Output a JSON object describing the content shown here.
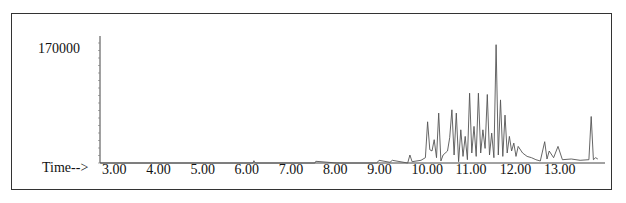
{
  "chart_data": {
    "type": "line",
    "title": "",
    "xlabel": "Time-->",
    "ylabel": "",
    "x_ticks": [
      "3.00",
      "4.00",
      "5.00",
      "6.00",
      "7.00",
      "8.00",
      "9.00",
      "10.00",
      "11.00",
      "12.00",
      "13.00"
    ],
    "y_ticks": [
      "170000"
    ],
    "xlim": [
      2.65,
      13.95
    ],
    "ylim": [
      0,
      190000
    ],
    "grid": false,
    "series": [
      {
        "name": "TIC",
        "x": [
          2.65,
          6.1,
          6.12,
          6.15,
          7.5,
          7.52,
          8.0,
          8.9,
          8.95,
          9.2,
          9.25,
          9.6,
          9.65,
          9.7,
          9.9,
          10.0,
          10.05,
          10.1,
          10.15,
          10.2,
          10.25,
          10.3,
          10.35,
          10.4,
          10.5,
          10.55,
          10.6,
          10.65,
          10.7,
          10.75,
          10.8,
          10.85,
          10.9,
          10.95,
          11.0,
          11.05,
          11.1,
          11.15,
          11.2,
          11.25,
          11.3,
          11.35,
          11.4,
          11.45,
          11.5,
          11.55,
          11.6,
          11.65,
          11.7,
          11.75,
          11.8,
          11.85,
          11.9,
          11.95,
          12.0,
          12.05,
          12.1,
          12.2,
          12.3,
          12.4,
          12.5,
          12.6,
          12.7,
          12.75,
          12.8,
          12.9,
          13.0,
          13.1,
          13.3,
          13.5,
          13.7,
          13.75,
          13.8,
          13.85,
          13.9
        ],
        "y": [
          0,
          0,
          3500,
          0,
          0,
          2500,
          0,
          0,
          4000,
          1000,
          4000,
          0,
          12000,
          2000,
          4000,
          8000,
          62000,
          20000,
          18000,
          35000,
          8000,
          75000,
          3000,
          12000,
          18000,
          38000,
          80000,
          12000,
          75000,
          2000,
          50000,
          10000,
          40000,
          5000,
          105000,
          15000,
          55000,
          10000,
          105000,
          15000,
          50000,
          22000,
          103000,
          12000,
          45000,
          8000,
          178000,
          12000,
          95000,
          10000,
          72000,
          15000,
          40000,
          18000,
          30000,
          10000,
          25000,
          15000,
          10000,
          8000,
          5000,
          3000,
          32000,
          6000,
          18000,
          8000,
          25000,
          5000,
          6000,
          4000,
          5000,
          70000,
          5000,
          8000,
          6000
        ]
      }
    ]
  },
  "axis": {
    "time_label": "Time-->",
    "y_max_label": "170000"
  }
}
